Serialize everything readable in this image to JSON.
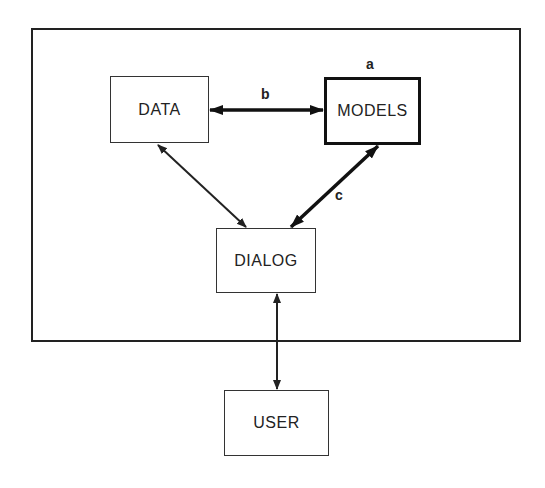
{
  "diagram": {
    "nodes": {
      "data": "DATA",
      "models": "MODELS",
      "dialog": "DIALOG",
      "user": "USER"
    },
    "labels": {
      "a": "a",
      "b": "b",
      "c": "c"
    },
    "edges": [
      {
        "from": "DATA",
        "to": "MODELS",
        "label": "b",
        "bidirectional": true,
        "weight": "thick"
      },
      {
        "from": "DATA",
        "to": "DIALOG",
        "bidirectional": true,
        "weight": "normal"
      },
      {
        "from": "MODELS",
        "to": "DIALOG",
        "label": "c",
        "bidirectional": true,
        "weight": "thick"
      },
      {
        "from": "DIALOG",
        "to": "USER",
        "bidirectional": true,
        "weight": "normal"
      }
    ],
    "colors": {
      "stroke": "#222222",
      "background": "#ffffff"
    }
  }
}
